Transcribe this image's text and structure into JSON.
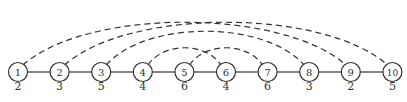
{
  "nodes": [
    {
      "id": "1",
      "weight": "2"
    },
    {
      "id": "2",
      "weight": "3"
    },
    {
      "id": "3",
      "weight": "5"
    },
    {
      "id": "4",
      "weight": "4"
    },
    {
      "id": "5",
      "weight": "6"
    },
    {
      "id": "6",
      "weight": "4"
    },
    {
      "id": "7",
      "weight": "6"
    },
    {
      "id": "8",
      "weight": "3"
    },
    {
      "id": "9",
      "weight": "2"
    },
    {
      "id": "10",
      "weight": "5"
    }
  ],
  "path_edges": [
    [
      1,
      2
    ],
    [
      2,
      3
    ],
    [
      3,
      4
    ],
    [
      4,
      5
    ],
    [
      5,
      6
    ],
    [
      6,
      7
    ],
    [
      7,
      8
    ],
    [
      8,
      9
    ],
    [
      9,
      10
    ]
  ],
  "dashed_arcs": [
    [
      1,
      9
    ],
    [
      2,
      10
    ],
    [
      3,
      8
    ],
    [
      4,
      6
    ],
    [
      5,
      7
    ]
  ]
}
